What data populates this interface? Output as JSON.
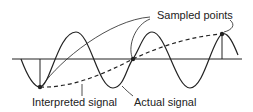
{
  "diagram": {
    "labels": {
      "sampled_points": "Sampled points",
      "interpreted_signal": "Interpreted signal",
      "actual_signal": "Actual signal"
    },
    "colors": {
      "ink": "#222222",
      "background": "#ffffff"
    },
    "sample_points": [
      {
        "x": 40,
        "y": 87
      },
      {
        "x": 133,
        "y": 59
      },
      {
        "x": 222,
        "y": 34
      }
    ]
  }
}
